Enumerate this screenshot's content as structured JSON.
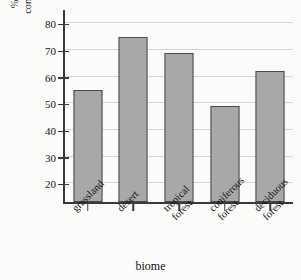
{
  "chart_data": {
    "type": "bar",
    "title": "",
    "xlabel": "biome",
    "ylabel": "% of ammonium converted to nitrate",
    "ylabel_lines": [
      "% of ammonium",
      "converted to nitrate"
    ],
    "categories": [
      "grassland",
      "desert",
      "tropical forest",
      "coniferous forest",
      "deciduous forest"
    ],
    "category_lines": [
      [
        "grassland"
      ],
      [
        "desert"
      ],
      [
        "tropical",
        "forest"
      ],
      [
        "coniferous",
        "forest"
      ],
      [
        "deciduous",
        "forest"
      ]
    ],
    "values": [
      55,
      75,
      69,
      49,
      62
    ],
    "ylim": [
      13,
      85
    ],
    "yticks": [
      20,
      30,
      40,
      50,
      60,
      70,
      80
    ],
    "ytick_labels": [
      "20",
      "30",
      "40",
      "50",
      "60",
      "70",
      "80"
    ],
    "grid": true,
    "legend": false,
    "legend_position": "none",
    "bar_color": "#a8a8a8",
    "bar_edge_color": "#4a4a4a",
    "grid_color": "#d5d5d3",
    "axis_color": "#3a3a3a",
    "background_color": "#fbfbfa"
  }
}
